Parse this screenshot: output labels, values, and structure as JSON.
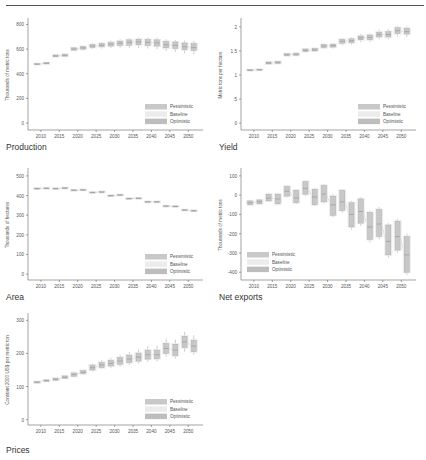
{
  "colors": {
    "pessimistic": "#c8c8c8",
    "baseline": "#ececec",
    "optimistic": "#bdbdbd",
    "box_stroke": "#9a9a9a",
    "axis": "#666666",
    "text": "#555555"
  },
  "legend": [
    "Pessimistic",
    "Baseline",
    "Optimistic"
  ],
  "chart_data": [
    {
      "id": "production",
      "type": "box",
      "caption": "Production",
      "ylabel": "Thousands of metric tons",
      "yticks": [
        0,
        200,
        400,
        600,
        800
      ],
      "ylim": [
        -40,
        820
      ],
      "xticks": [
        2010,
        2015,
        2020,
        2025,
        2030,
        2035,
        2040,
        2045,
        2050
      ],
      "legend_position": "bottom-right",
      "x": [
        2009,
        2011.5,
        2014,
        2016.5,
        2019,
        2021.5,
        2024,
        2026.5,
        2029,
        2031.5,
        2034,
        2036.5,
        2039,
        2041.5,
        2044,
        2046.5,
        2049,
        2051.5
      ],
      "median": [
        478,
        485,
        545,
        550,
        600,
        610,
        625,
        632,
        640,
        648,
        655,
        658,
        655,
        650,
        635,
        630,
        620,
        612
      ],
      "q1": [
        474,
        480,
        538,
        543,
        592,
        600,
        614,
        620,
        625,
        630,
        632,
        635,
        630,
        625,
        610,
        605,
        595,
        590
      ],
      "q3": [
        482,
        490,
        552,
        558,
        610,
        620,
        636,
        645,
        655,
        665,
        675,
        680,
        678,
        675,
        662,
        658,
        650,
        645
      ],
      "min": [
        470,
        476,
        530,
        535,
        585,
        590,
        600,
        605,
        608,
        610,
        610,
        610,
        605,
        600,
        585,
        578,
        565,
        560
      ],
      "max": [
        486,
        494,
        560,
        565,
        618,
        630,
        648,
        658,
        670,
        680,
        690,
        695,
        695,
        692,
        680,
        675,
        670,
        665
      ]
    },
    {
      "id": "yield",
      "type": "box",
      "caption": "Yield",
      "ylabel": "Metric tons per hectare",
      "yticks": [
        0,
        0.5,
        1,
        1.5,
        2
      ],
      "yticklabels": [
        "0",
        ".5",
        "1",
        "1.5",
        "2"
      ],
      "ylim": [
        -0.1,
        2.1
      ],
      "xticks": [
        2010,
        2015,
        2020,
        2025,
        2030,
        2035,
        2040,
        2045,
        2050
      ],
      "legend_position": "bottom-right",
      "x": [
        2009,
        2011.5,
        2014,
        2016.5,
        2019,
        2021.5,
        2024,
        2026.5,
        2029,
        2031.5,
        2034,
        2036.5,
        2039,
        2041.5,
        2044,
        2046.5,
        2049,
        2051.5
      ],
      "median": [
        1.1,
        1.11,
        1.25,
        1.26,
        1.42,
        1.43,
        1.51,
        1.52,
        1.6,
        1.61,
        1.7,
        1.71,
        1.77,
        1.78,
        1.84,
        1.84,
        1.92,
        1.9
      ],
      "q1": [
        1.09,
        1.1,
        1.23,
        1.24,
        1.4,
        1.41,
        1.49,
        1.5,
        1.57,
        1.58,
        1.66,
        1.67,
        1.73,
        1.73,
        1.79,
        1.79,
        1.86,
        1.85
      ],
      "q3": [
        1.11,
        1.12,
        1.27,
        1.28,
        1.44,
        1.45,
        1.54,
        1.55,
        1.63,
        1.64,
        1.74,
        1.75,
        1.81,
        1.83,
        1.89,
        1.9,
        1.98,
        1.97
      ],
      "min": [
        1.08,
        1.09,
        1.22,
        1.23,
        1.38,
        1.39,
        1.47,
        1.48,
        1.54,
        1.55,
        1.62,
        1.63,
        1.68,
        1.68,
        1.74,
        1.74,
        1.8,
        1.79
      ],
      "max": [
        1.12,
        1.13,
        1.28,
        1.29,
        1.46,
        1.47,
        1.56,
        1.57,
        1.66,
        1.67,
        1.77,
        1.78,
        1.85,
        1.86,
        1.94,
        1.95,
        2.02,
        2.01
      ]
    },
    {
      "id": "area",
      "type": "box",
      "caption": "Area",
      "ylabel": "Thousands of hectares",
      "yticks": [
        0,
        100,
        200,
        300,
        400,
        500
      ],
      "ylim": [
        -20,
        520
      ],
      "xticks": [
        2010,
        2015,
        2020,
        2025,
        2030,
        2035,
        2040,
        2045,
        2050
      ],
      "legend_position": "bottom-right",
      "x": [
        2009,
        2011.5,
        2014,
        2016.5,
        2019,
        2021.5,
        2024,
        2026.5,
        2029,
        2031.5,
        2034,
        2036.5,
        2039,
        2041.5,
        2044,
        2046.5,
        2049,
        2051.5
      ],
      "median": [
        436,
        437,
        436,
        438,
        427,
        429,
        416,
        418,
        400,
        403,
        385,
        386,
        368,
        368,
        346,
        345,
        326,
        323
      ],
      "q1": [
        434,
        435,
        434,
        436,
        425,
        427,
        414,
        416,
        398,
        401,
        383,
        384,
        366,
        366,
        344,
        343,
        324,
        321
      ],
      "q3": [
        438,
        439,
        438,
        440,
        429,
        431,
        418,
        420,
        402,
        405,
        387,
        388,
        370,
        370,
        348,
        347,
        328,
        325
      ],
      "min": [
        433,
        434,
        433,
        435,
        424,
        426,
        413,
        415,
        397,
        400,
        382,
        383,
        365,
        365,
        343,
        342,
        323,
        320
      ],
      "max": [
        439,
        440,
        439,
        441,
        430,
        432,
        419,
        421,
        403,
        406,
        388,
        389,
        371,
        371,
        349,
        348,
        329,
        326
      ]
    },
    {
      "id": "net_exports",
      "type": "box",
      "caption": "Net exports",
      "ylabel": "Thousands of metric tons",
      "yticks": [
        -400,
        -300,
        -200,
        -100,
        0,
        100
      ],
      "ylim": [
        -430,
        120
      ],
      "xticks": [
        2010,
        2015,
        2020,
        2025,
        2030,
        2035,
        2040,
        2045,
        2050
      ],
      "legend_position": "bottom-left",
      "x": [
        2009,
        2011.5,
        2014,
        2016.5,
        2019,
        2021.5,
        2024,
        2026.5,
        2029,
        2031.5,
        2034,
        2036.5,
        2039,
        2041.5,
        2044,
        2046.5,
        2049,
        2051.5
      ],
      "median": [
        -40,
        -35,
        -15,
        -20,
        20,
        -15,
        35,
        -10,
        5,
        -50,
        -35,
        -100,
        -85,
        -165,
        -150,
        -240,
        -215,
        -310
      ],
      "q1": [
        -50,
        -45,
        -30,
        -45,
        -5,
        -40,
        5,
        -50,
        -35,
        -105,
        -80,
        -165,
        -145,
        -230,
        -215,
        -310,
        -285,
        -400
      ],
      "q3": [
        -30,
        -25,
        5,
        5,
        45,
        25,
        70,
        30,
        50,
        -5,
        25,
        -40,
        -20,
        -90,
        -75,
        -155,
        -135,
        -215
      ],
      "min": [
        -55,
        -52,
        -35,
        -52,
        -12,
        -48,
        -5,
        -58,
        -45,
        -115,
        -92,
        -178,
        -160,
        -245,
        -230,
        -325,
        -300,
        -415
      ],
      "max": [
        -25,
        -20,
        12,
        12,
        52,
        32,
        78,
        38,
        58,
        5,
        32,
        -30,
        -10,
        -80,
        -62,
        -145,
        -122,
        -200
      ]
    },
    {
      "id": "prices",
      "type": "box",
      "caption": "Prices",
      "ylabel": "Constant 2000 US$ per metric ton",
      "yticks": [
        0,
        100,
        200,
        300
      ],
      "ylim": [
        -10,
        310
      ],
      "xticks": [
        2010,
        2015,
        2020,
        2025,
        2030,
        2035,
        2040,
        2045,
        2050
      ],
      "legend_position": "bottom-right",
      "x": [
        2009,
        2011.5,
        2014,
        2016.5,
        2019,
        2021.5,
        2024,
        2026.5,
        2029,
        2031.5,
        2034,
        2036.5,
        2039,
        2041.5,
        2044,
        2046.5,
        2049,
        2051.5
      ],
      "median": [
        113,
        118,
        122,
        128,
        136,
        143,
        157,
        165,
        170,
        177,
        183,
        189,
        196,
        196,
        215,
        210,
        235,
        222
      ],
      "q1": [
        111,
        116,
        119,
        125,
        131,
        139,
        150,
        157,
        162,
        167,
        172,
        177,
        183,
        184,
        200,
        193,
        218,
        205
      ],
      "q3": [
        115,
        120,
        125,
        132,
        141,
        148,
        165,
        173,
        179,
        188,
        195,
        201,
        210,
        210,
        230,
        228,
        252,
        240
      ],
      "min": [
        110,
        115,
        117,
        123,
        128,
        136,
        145,
        152,
        156,
        160,
        165,
        170,
        175,
        176,
        190,
        184,
        205,
        196
      ],
      "max": [
        116,
        121,
        128,
        135,
        145,
        152,
        170,
        180,
        187,
        196,
        205,
        212,
        222,
        224,
        245,
        242,
        265,
        255
      ]
    }
  ]
}
